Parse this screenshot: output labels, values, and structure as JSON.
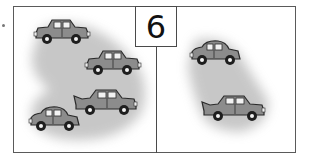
{
  "worksheet": {
    "number_label": "6",
    "left_panel": {
      "car_count": 4,
      "description": "four cars on grey background"
    },
    "right_panel": {
      "car_count": 2,
      "description": "two cars on grey background"
    }
  },
  "colors": {
    "border": "#4a4a4a",
    "car_body": "#8a8a8a",
    "car_dark": "#2b2b2b",
    "smudge": "#cfcfcf"
  }
}
